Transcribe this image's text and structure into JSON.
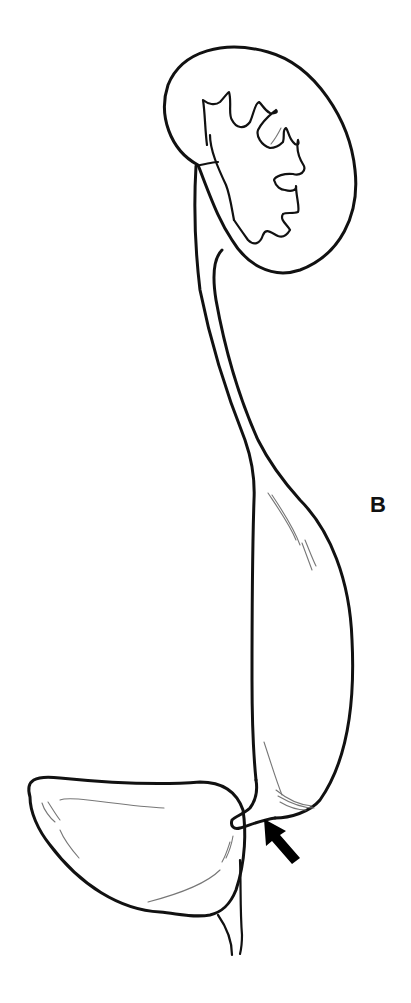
{
  "figure": {
    "panel_label": "B",
    "structures": [
      "kidney",
      "renal-calyces",
      "ureter",
      "dilated-distal-ureter",
      "ureterovesical-junction",
      "bladder",
      "urethra"
    ],
    "annotations": [
      {
        "type": "arrow",
        "points_to": "ureterovesical-junction",
        "color": "#000000"
      }
    ],
    "line_color": "#111111",
    "background": "#ffffff"
  }
}
